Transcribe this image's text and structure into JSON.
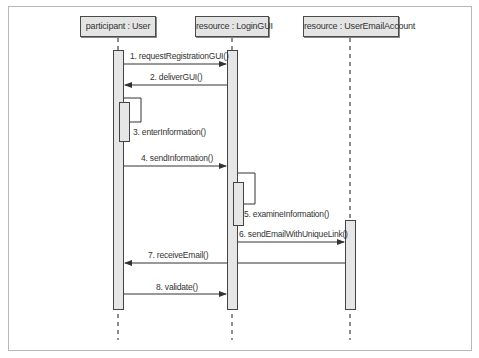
{
  "diagram": {
    "type": "uml-sequence",
    "participants": [
      {
        "label": "participant : User"
      },
      {
        "label": "resource : LoginGUI"
      },
      {
        "label": "resource : UserEmailAccount"
      }
    ],
    "messages": [
      {
        "label": "1. requestRegistrationGUI()",
        "from": "User",
        "to": "LoginGUI"
      },
      {
        "label": "2. deliverGUI()",
        "from": "LoginGUI",
        "to": "User"
      },
      {
        "label": "3. enterInformation()",
        "from": "User",
        "to": "User"
      },
      {
        "label": "4. sendInformation()",
        "from": "User",
        "to": "LoginGUI"
      },
      {
        "label": "5. examineInformation()",
        "from": "LoginGUI",
        "to": "LoginGUI"
      },
      {
        "label": "6. sendEmailWithUniqueLink()",
        "from": "LoginGUI",
        "to": "UserEmailAccount"
      },
      {
        "label": "7. receiveEmail()",
        "from": "UserEmailAccount",
        "to": "User"
      },
      {
        "label": "8. validate()",
        "from": "User",
        "to": "LoginGUI"
      }
    ],
    "colors": {
      "box_fill": "#e4e4e4",
      "bar_fill": "#e6e6e6",
      "line": "#444444",
      "frame": "#b8b8b8"
    }
  }
}
